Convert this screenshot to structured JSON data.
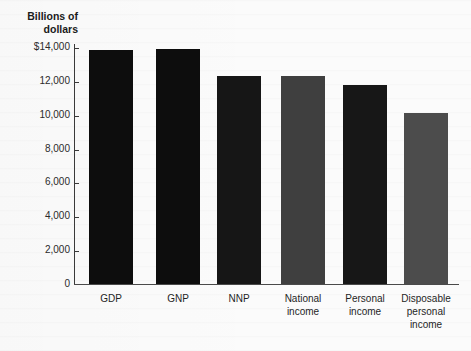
{
  "chart_data": {
    "type": "bar",
    "title": "Billions of dollars",
    "xlabel": "",
    "ylabel": "Billions of dollars",
    "ylim": [
      0,
      14000
    ],
    "grid": false,
    "legend": null,
    "y_ticks": [
      {
        "value": 14000,
        "label": "$14,000"
      },
      {
        "value": 12000,
        "label": "12,000"
      },
      {
        "value": 10000,
        "label": "10,000"
      },
      {
        "value": 8000,
        "label": "8,000"
      },
      {
        "value": 6000,
        "label": "6,000"
      },
      {
        "value": 4000,
        "label": "4,000"
      },
      {
        "value": 2000,
        "label": "2,000"
      },
      {
        "value": 0,
        "label": "0"
      }
    ],
    "categories": [
      "GDP",
      "GNP",
      "NNP",
      "National\nincome",
      "Personal\nincome",
      "Disposable\npersonal\nincome"
    ],
    "values": [
      13900,
      13950,
      12350,
      12350,
      11830,
      10170
    ],
    "bar_colors": [
      "#0d0d0d",
      "#0d0d0d",
      "#161616",
      "#3f3f3f",
      "#171717",
      "#4c4c4c"
    ]
  },
  "axis": {
    "title_line1": "Billions",
    "title_line2": "of dollars"
  }
}
